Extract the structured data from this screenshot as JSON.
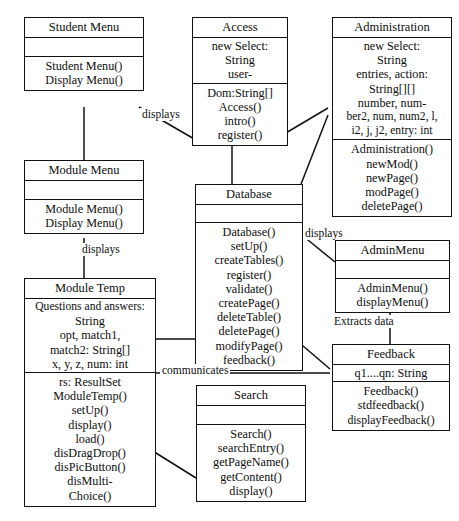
{
  "diagram": {
    "type": "uml-class-diagram",
    "title": "",
    "canvas": {
      "width": 459,
      "height": 521
    },
    "style": {
      "box_fill": "#ffffff",
      "line_color": "#111111",
      "text_color": "#0d0d0d"
    }
  },
  "classes": [
    {
      "id": "student-menu",
      "name": "Student Menu",
      "attributes": [],
      "operations": [
        "Student Menu()",
        "Display Menu()"
      ]
    },
    {
      "id": "module-menu",
      "name": "Module Menu",
      "attributes": [],
      "operations": [
        "Module Menu()",
        "Display Menu()"
      ]
    },
    {
      "id": "module-temp",
      "name": "Module Temp",
      "attributes": [
        "Questions and answers:",
        "String",
        "opt, match1,",
        "match2: String[]",
        "x, y, z, num: int"
      ],
      "operations": [
        "rs: ResultSet",
        "ModuleTemp()",
        "setUp()",
        "display()",
        "load()",
        "disDragDrop()",
        "disPicButton()",
        "disMulti-",
        "Choice()"
      ]
    },
    {
      "id": "access",
      "name": "Access",
      "attributes": [
        "new Select:",
        "String",
        "user-"
      ],
      "operations": [
        "Dom:String[]",
        "Access()",
        "intro()",
        "register()"
      ]
    },
    {
      "id": "database",
      "name": "Database",
      "attributes": [],
      "operations": [
        "Database()",
        "setUp()",
        "createTables()",
        "register()",
        "validate()",
        "createPage()",
        "deleteTable()",
        "deletePage()",
        "modifyPage()",
        "feedback()"
      ]
    },
    {
      "id": "search",
      "name": "Search",
      "attributes": [],
      "operations": [
        "Search()",
        "searchEntry()",
        "getPageName()",
        "getContent()",
        "display()"
      ]
    },
    {
      "id": "administration",
      "name": "Administration",
      "attributes": [
        "new Select:",
        "String",
        "entries, action:",
        "String[][]",
        "number, num-",
        "ber2, num, num2, l,",
        "i2, j, j2, entry: int"
      ],
      "operations": [
        "Administration()",
        "newMod()",
        "newPage()",
        "modPage()",
        "deletePage()"
      ]
    },
    {
      "id": "admin-menu",
      "name": "AdminMenu",
      "attributes": [],
      "operations": [
        "AdminMenu()",
        "displayMenu()"
      ]
    },
    {
      "id": "feedback",
      "name": "Feedback",
      "attributes": [
        "q1....qn: String"
      ],
      "operations": [
        "Feedback()",
        "stdfeedback()",
        "displayFeedback()"
      ]
    }
  ],
  "relationships": [
    {
      "id": "rel-student-module",
      "from": "student-menu",
      "to": "module-menu",
      "label": ""
    },
    {
      "id": "rel-module-temp",
      "from": "module-menu",
      "to": "module-temp",
      "label": "displays"
    },
    {
      "id": "rel-student-access",
      "from": "student-menu",
      "to": "access",
      "label": "displays"
    },
    {
      "id": "rel-access-database",
      "from": "access",
      "to": "database",
      "label": ""
    },
    {
      "id": "rel-database-admin",
      "from": "database",
      "to": "administration",
      "label": ""
    },
    {
      "id": "rel-database-adminmenu",
      "from": "database",
      "to": "admin-menu",
      "label": "displays"
    },
    {
      "id": "rel-adminmenu-feedback",
      "from": "admin-menu",
      "to": "feedback",
      "label": "Extracts data"
    },
    {
      "id": "rel-moduletemp-database",
      "from": "module-temp",
      "to": "database",
      "label": ""
    },
    {
      "id": "rel-moduletemp-feedback",
      "from": "module-temp",
      "to": "feedback",
      "label": "communicates"
    },
    {
      "id": "rel-moduletemp-search",
      "from": "module-temp",
      "to": "search",
      "label": ""
    },
    {
      "id": "rel-database-search",
      "from": "database",
      "to": "search",
      "label": ""
    }
  ],
  "edge_labels": {
    "displays_student_access": "displays",
    "displays_module_temp": "displays",
    "displays_database_adminmenu": "displays",
    "extracts_data": "Extracts data",
    "communicates": "communicates"
  }
}
